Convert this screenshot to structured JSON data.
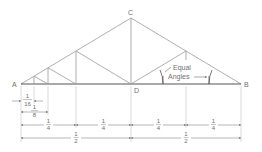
{
  "diagram": {
    "type": "roof-truss-geometry",
    "colors": {
      "line": "#9a9a9a",
      "chord": "#555555",
      "text": "#6e6e6e",
      "background": "#ffffff"
    },
    "points": {
      "A": {
        "label": "A",
        "x": 21,
        "y": 84
      },
      "B": {
        "label": "B",
        "x": 241,
        "y": 84
      },
      "C": {
        "label": "C",
        "x": 131,
        "y": 18
      },
      "D": {
        "label": "D",
        "x": 131,
        "y": 84
      }
    },
    "annotation": {
      "line1": "Equal",
      "line2": "Angles"
    },
    "dimensions": {
      "sixteenth": {
        "num": "1",
        "den": "16"
      },
      "eighth": {
        "num": "1",
        "den": "8"
      },
      "quarters": [
        {
          "num": "1",
          "den": "4"
        },
        {
          "num": "1",
          "den": "4"
        },
        {
          "num": "1",
          "den": "4"
        },
        {
          "num": "1",
          "den": "4"
        }
      ],
      "halves": [
        {
          "num": "1",
          "den": "2"
        },
        {
          "num": "1",
          "den": "2"
        }
      ]
    }
  }
}
